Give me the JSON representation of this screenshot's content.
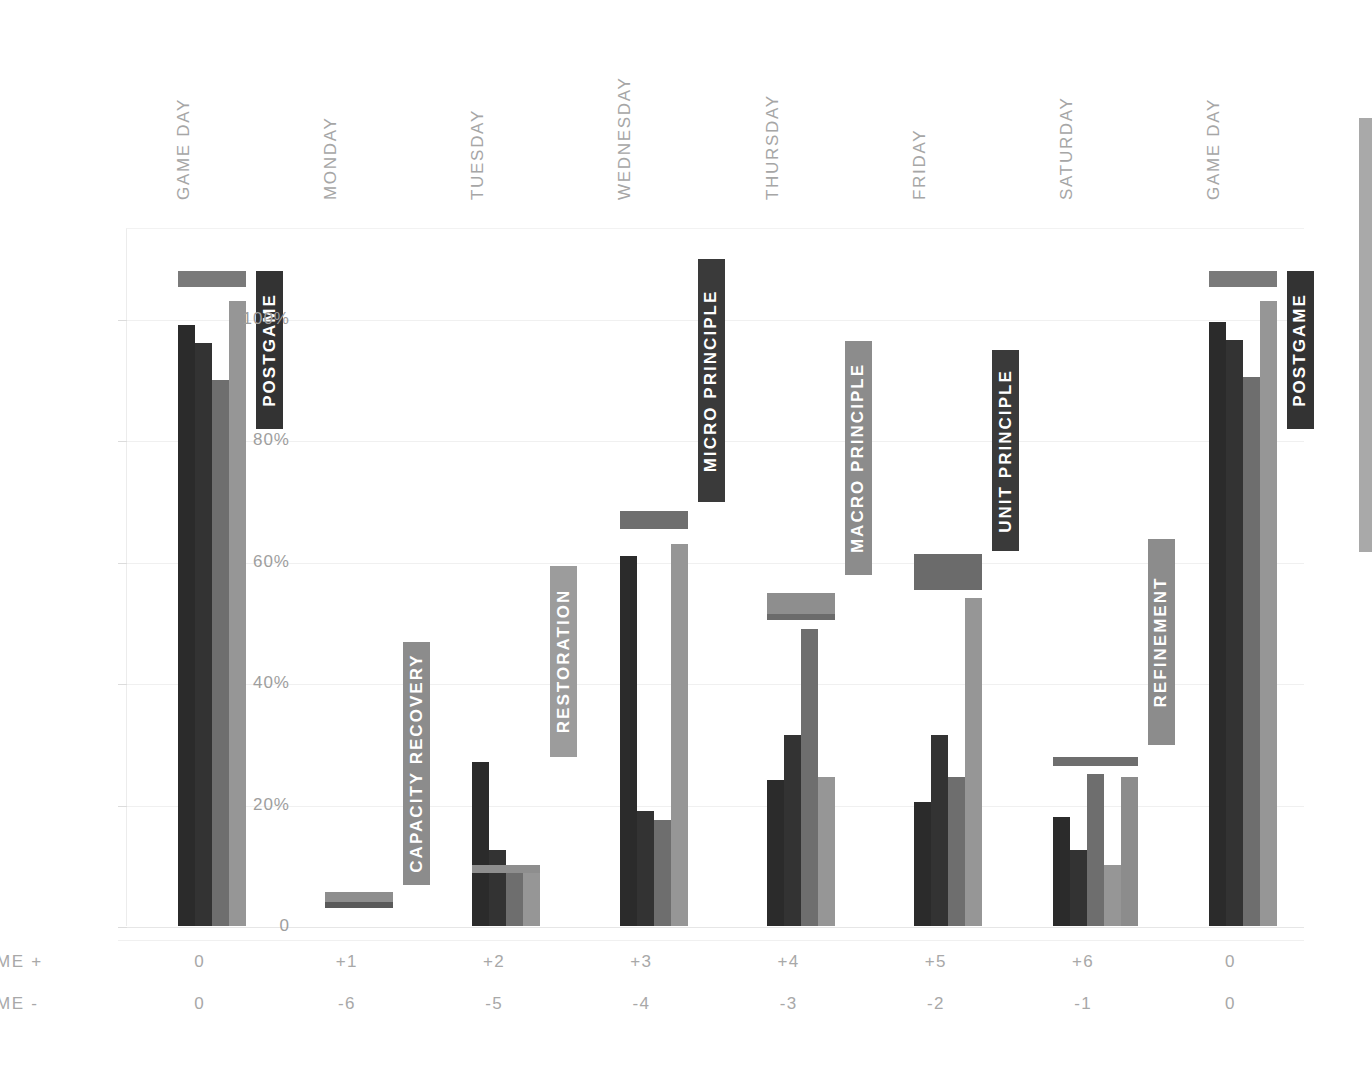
{
  "chart_data": {
    "type": "bar",
    "title": "",
    "subtitle": "",
    "xlabel": "",
    "ylabel": "",
    "ylim": [
      0,
      115
    ],
    "grid": true,
    "legend_position": "none",
    "y_ticks": [
      {
        "value": 0,
        "label": "0"
      },
      {
        "value": 20,
        "label": "20%"
      },
      {
        "value": 40,
        "label": "40%"
      },
      {
        "value": 60,
        "label": "60%"
      },
      {
        "value": 80,
        "label": "80%"
      },
      {
        "value": 100,
        "label": "100%"
      }
    ],
    "categories": [
      "GAME DAY",
      "MONDAY",
      "TUESDAY",
      "WEDNESDAY",
      "THURSDAY",
      "FRIDAY",
      "SATURDAY",
      "GAME DAY"
    ],
    "series": [
      {
        "name": "series-1",
        "color": "#2b2b2b",
        "values": [
          99,
          0,
          27,
          61,
          24,
          20.5,
          18,
          99.5
        ]
      },
      {
        "name": "series-2",
        "color": "#333333",
        "values": [
          96,
          0,
          12.5,
          19,
          31.5,
          31.5,
          12.5,
          96.5
        ]
      },
      {
        "name": "series-3",
        "color": "#6e6e6e",
        "values": [
          90,
          0,
          10,
          17.5,
          49,
          24.5,
          25,
          90.5
        ]
      },
      {
        "name": "series-4",
        "color": "#969696",
        "values": [
          103,
          0,
          10,
          63,
          24.5,
          54,
          10,
          103
        ]
      },
      {
        "name": "series-5",
        "color": "#8c8c8c",
        "values": [
          0,
          0,
          0,
          0,
          0,
          0,
          24.5,
          0
        ]
      }
    ],
    "phase_brackets": [
      {
        "label": "POSTGAME",
        "group": 0,
        "top": 108,
        "bottom": 105.5,
        "bar_color": "#7a7a7a",
        "accent_color": "#7a7a7a",
        "chip_color": "#333333",
        "chip_top": 108,
        "chip_bottom": 82
      },
      {
        "label": "CAPACITY RECOVERY",
        "group": 1,
        "top": 5.8,
        "bottom": 3.2,
        "bar_color": "#8e8e8e",
        "accent_color": "#5a5a5a",
        "chip_color": "#8c8c8c",
        "chip_top": 47,
        "chip_bottom": 7
      },
      {
        "label": "RESTORATION",
        "group": 2,
        "top": 10.2,
        "bottom": 9.2,
        "bar_color": "#8e8e8e",
        "accent_color": "#8e8e8e",
        "chip_color": "#9c9c9c",
        "chip_top": 59.5,
        "chip_bottom": 28
      },
      {
        "label": "MICRO PRINCIPLE",
        "group": 3,
        "top": 68.5,
        "bottom": 65.5,
        "bar_color": "#6e6e6e",
        "accent_color": "#6e6e6e",
        "chip_color": "#3a3a3a",
        "chip_top": 110,
        "chip_bottom": 70
      },
      {
        "label": "MACRO PRINCIPLE",
        "group": 4,
        "top": 55,
        "bottom": 50.5,
        "bar_color": "#8e8e8e",
        "accent_color": "#6b6b6b",
        "chip_color": "#8c8c8c",
        "chip_top": 96.5,
        "chip_bottom": 58
      },
      {
        "label": "UNIT PRINCIPLE",
        "group": 5,
        "top": 61.5,
        "bottom": 55.5,
        "bar_color": "#6b6b6b",
        "accent_color": "#6b6b6b",
        "chip_color": "#3a3a3a",
        "chip_top": 95,
        "chip_bottom": 62
      },
      {
        "label": "REFINEMENT",
        "group": 6,
        "top": 28,
        "bottom": 26.5,
        "bar_color": "#6e6e6e",
        "accent_color": "#6e6e6e",
        "chip_color": "#8c8c8c",
        "chip_top": 64,
        "chip_bottom": 30
      },
      {
        "label": "POSTGAME",
        "group": 7,
        "top": 108,
        "bottom": 105.5,
        "bar_color": "#7a7a7a",
        "accent_color": "#7a7a7a",
        "chip_color": "#333333",
        "chip_top": 108,
        "chip_bottom": 82
      }
    ],
    "axis_table": {
      "rows": [
        {
          "label": "GAME +",
          "values": [
            "0",
            "+1",
            "+2",
            "+3",
            "+4",
            "+5",
            "+6",
            "0"
          ]
        },
        {
          "label": "GAME -",
          "values": [
            "0",
            "-6",
            "-5",
            "-4",
            "-3",
            "-2",
            "-1",
            "0"
          ]
        }
      ]
    }
  },
  "colors": {
    "background": "#ffffff",
    "gridline": "#f0f0f0",
    "axis_text": "#a6a6a6",
    "scrollbar_thumb": "#a9a9a9"
  },
  "scrollbar": {
    "name": "vertical-scrollbar"
  }
}
